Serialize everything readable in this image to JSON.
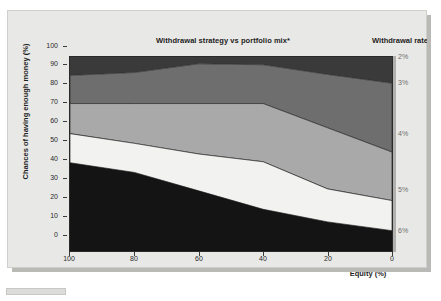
{
  "chart_data": {
    "type": "area",
    "title": "Withdrawal strategy vs portfolio mix*",
    "xlabel": "Equity (%)",
    "ylabel": "Chances of having enough money (%)",
    "xlim": [
      100,
      0
    ],
    "ylim": [
      0,
      100
    ],
    "xticks": [
      "100",
      "80",
      "60",
      "40",
      "20",
      "0"
    ],
    "yticks": [
      "0",
      "10",
      "20",
      "30",
      "40",
      "50",
      "60",
      "70",
      "80",
      "90",
      "100"
    ],
    "grid": false,
    "stacked": true,
    "x": [
      100,
      80,
      60,
      40,
      20,
      0
    ],
    "series": [
      {
        "name": "6%",
        "withdrawal_rate": "6%",
        "color": "#141414",
        "cumulative_top": [
          45.5,
          40.5,
          31.0,
          21.5,
          15.0,
          10.5
        ],
        "values": [
          45.5,
          40.5,
          31.0,
          21.5,
          15.0,
          10.5
        ]
      },
      {
        "name": "5%",
        "withdrawal_rate": "5%",
        "color": "#f2f2f0",
        "cumulative_top": [
          60.5,
          55.5,
          50.0,
          46.0,
          32.0,
          26.0
        ],
        "values": [
          15.0,
          15.0,
          19.0,
          24.5,
          17.0,
          15.5
        ]
      },
      {
        "name": "4%",
        "withdrawal_rate": "4%",
        "color": "#a9a9a9",
        "cumulative_top": [
          76.0,
          76.0,
          76.0,
          76.0,
          63.5,
          51.0
        ],
        "values": [
          15.5,
          20.5,
          26.0,
          30.0,
          31.5,
          25.0
        ]
      },
      {
        "name": "3%",
        "withdrawal_rate": "3%",
        "color": "#6e6e6e",
        "cumulative_top": [
          90.5,
          92.0,
          96.5,
          96.0,
          91.0,
          86.5
        ],
        "values": [
          14.5,
          16.0,
          20.5,
          20.0,
          27.5,
          35.5
        ]
      },
      {
        "name": "2%",
        "withdrawal_rate": "2%",
        "color": "#3a3a3a",
        "cumulative_top": [
          100,
          100,
          100,
          100,
          100,
          100
        ],
        "values": [
          9.5,
          8.0,
          3.5,
          4.0,
          9.0,
          13.5
        ]
      }
    ],
    "right_axis": {
      "title": "Withdrawal rate",
      "ticks": [
        {
          "label": "2%",
          "y_pct": 98.5
        },
        {
          "label": "3%",
          "y_pct": 85.0
        },
        {
          "label": "4%",
          "y_pct": 59.0
        },
        {
          "label": "5%",
          "y_pct": 30.0
        },
        {
          "label": "6%",
          "y_pct": 9.0
        }
      ]
    }
  },
  "chart": {
    "title": "Withdrawal strategy vs portfolio mix*",
    "legend_title": "Withdrawal rate",
    "xlabel": "Equity (%)",
    "ylabel": "Chances of having enough money (%)",
    "yticks": {
      "t0": "0",
      "t1": "10",
      "t2": "20",
      "t3": "30",
      "t4": "40",
      "t5": "50",
      "t6": "60",
      "t7": "70",
      "t8": "80",
      "t9": "90",
      "t10": "100"
    },
    "xticks": {
      "x0": "100",
      "x1": "80",
      "x2": "60",
      "x3": "40",
      "x4": "20",
      "x5": "0"
    },
    "rticks": {
      "r0": "2%",
      "r1": "3%",
      "r2": "4%",
      "r3": "5%",
      "r4": "6%"
    }
  },
  "colors": {
    "band_6pct": "#141414",
    "band_5pct": "#f2f2f0",
    "band_4pct": "#a9a9a9",
    "band_3pct": "#6e6e6e",
    "band_2pct": "#3a3a3a",
    "panel_bg": "#e8e8e6",
    "plot_border": "#2a2a2a"
  }
}
